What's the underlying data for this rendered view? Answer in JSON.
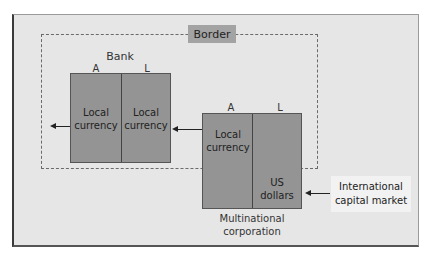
{
  "diagram": {
    "border_label": "Border",
    "bank": {
      "title": "Bank",
      "col_a": "A",
      "col_l": "L",
      "asset_line1": "Local",
      "asset_line2": "currency",
      "liability_line1": "Local",
      "liability_line2": "currency"
    },
    "multinational": {
      "title_line1": "Multinational",
      "title_line2": "corporation",
      "col_a": "A",
      "col_l": "L",
      "asset_line1": "Local",
      "asset_line2": "currency",
      "liability_line1": "US",
      "liability_line2": "dollars"
    },
    "international": {
      "line1": "International",
      "line2": "capital market"
    },
    "colors": {
      "box_fill": "#949494",
      "frame_fill": "#e6e6e6",
      "border_label_fill": "#a3a3a3"
    }
  }
}
